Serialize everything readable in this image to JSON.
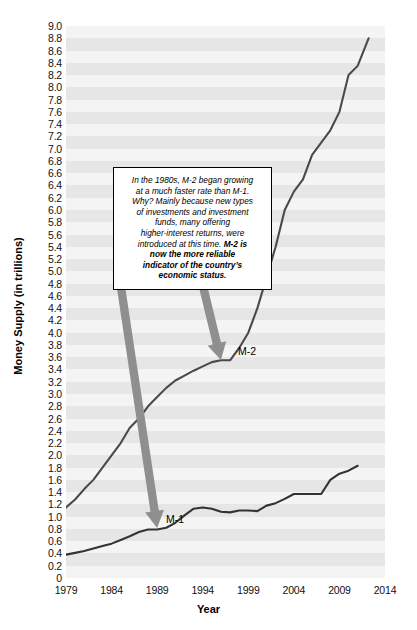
{
  "chart_data": {
    "type": "line",
    "title": "",
    "xlabel": "Year",
    "ylabel": "Money Supply (in trillions)",
    "xlim": [
      1979,
      2014
    ],
    "ylim": [
      0,
      9.0
    ],
    "grid": true,
    "grid_style": "alternating horizontal gray bands every 0.2",
    "legend": "direct labels on lines",
    "xticks": [
      "1979",
      "1984",
      "1989",
      "1994",
      "1999",
      "2004",
      "2009",
      "2014"
    ],
    "yticks": [
      "9.0",
      "8.8",
      "8.6",
      "8.4",
      "8.2",
      "8.0",
      "7.8",
      "7.6",
      "7.4",
      "7.2",
      "7.0",
      "6.8",
      "6.6",
      "6.4",
      "6.2",
      "6.0",
      "5.8",
      "5.6",
      "5.4",
      "5.2",
      "5.0",
      "4.8",
      "4.6",
      "4.4",
      "4.2",
      "4.0",
      "3.8",
      "3.6",
      "3.4",
      "3.2",
      "3.0",
      "2.8",
      "2.6",
      "2.4",
      "2.2",
      "2.0",
      "1.8",
      "1.6",
      "1.4",
      "1.2",
      "1.0",
      "0.8",
      "0.6",
      "0.4",
      "0.2",
      "0"
    ],
    "x": [
      1979,
      1980,
      1981,
      1982,
      1983,
      1984,
      1985,
      1986,
      1987,
      1988,
      1989,
      1990,
      1991,
      1992,
      1993,
      1994,
      1995,
      1996,
      1997,
      1998,
      1999,
      2000,
      2001,
      2002,
      2003,
      2004,
      2005,
      2006,
      2007,
      2008,
      2009,
      2010,
      2011
    ],
    "series": [
      {
        "name": "M-1",
        "color": "#333333",
        "values": [
          0.38,
          0.41,
          0.44,
          0.48,
          0.52,
          0.56,
          0.62,
          0.68,
          0.75,
          0.79,
          0.79,
          0.82,
          0.9,
          1.02,
          1.13,
          1.15,
          1.13,
          1.08,
          1.07,
          1.1,
          1.1,
          1.09,
          1.18,
          1.22,
          1.29,
          1.37,
          1.37,
          1.37,
          1.37,
          1.6,
          1.7,
          1.75,
          1.83
        ]
      },
      {
        "name": "M-2",
        "color": "#4a4a4a",
        "values": [
          1.15,
          1.28,
          1.45,
          1.6,
          1.8,
          2.0,
          2.2,
          2.45,
          2.6,
          2.8,
          2.95,
          3.1,
          3.22,
          3.3,
          3.38,
          3.45,
          3.52,
          3.55,
          3.55,
          3.75,
          4.0,
          4.4,
          4.9,
          5.4,
          6.0,
          6.3,
          6.5,
          6.9,
          7.1,
          7.3,
          7.6,
          8.2,
          8.35
        ],
        "endpoint_value": 8.8
      }
    ],
    "annotations": [
      {
        "name": "callout-box",
        "lines": [
          "In the 1980s, M-2 began growing",
          "at a much faster rate than M-1.",
          "Why? Mainly because new types",
          "of investments and investment",
          "funds, many offering",
          "higher-interest returns, were",
          "introduced at this time. "
        ],
        "bold_lines": [
          "M-2 is",
          "now the more reliable",
          "indicator of the country’s",
          "economic status."
        ]
      }
    ],
    "arrows": [
      {
        "name": "arrow-to-m1",
        "label": "M-1",
        "color": "#8f8f8f",
        "from_year": 1985,
        "to_year": 1989,
        "points_to": "M-1"
      },
      {
        "name": "arrow-to-m2",
        "label": "M-2",
        "color": "#8f8f8f",
        "from_year": 1994,
        "to_year": 1996,
        "points_to": "M-2"
      }
    ]
  },
  "labels": {
    "m1": "M-1",
    "m2": "M-2",
    "y_axis_title": "Money Supply (in trillions)",
    "x_axis_title": "Year"
  },
  "annotation": {
    "line1": "In the 1980s, M-2 began growing",
    "line2": "at a much faster rate than M-1.",
    "line3": "Why? Mainly because new types",
    "line4": "of investments and investment",
    "line5": "funds, many offering",
    "line6": "higher-interest returns, were",
    "line7": "introduced at this time. ",
    "bold1": "M-2 is",
    "bold2": "now the more reliable",
    "bold3": "indicator of the country’s",
    "bold4": "economic status."
  },
  "colors": {
    "plot_background": "#f4f4f4",
    "band": "#e6e6e6",
    "m1_line": "#333333",
    "m2_line": "#4a4a4a",
    "arrow": "#8f8f8f",
    "text": "#000000"
  }
}
